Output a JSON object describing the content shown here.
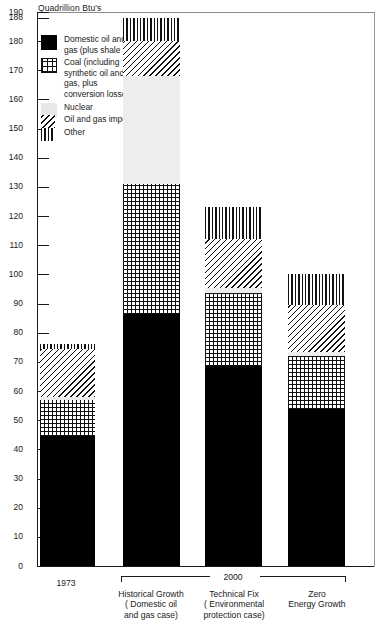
{
  "chart_data": {
    "type": "bar",
    "stacked": true,
    "title": "",
    "ylabel": "Quadrillion Btu's",
    "xlabel": "",
    "ylim": [
      0,
      190
    ],
    "yticks": [
      0,
      10,
      20,
      30,
      40,
      50,
      60,
      70,
      80,
      90,
      100,
      110,
      120,
      130,
      140,
      150,
      160,
      170,
      180,
      188,
      190
    ],
    "grid": false,
    "legend_position": "upper-left",
    "series": [
      {
        "name": "Domestic oil and gas (plus shale oil)",
        "key": "oil",
        "pattern": "solid-black",
        "values": [
          44.5,
          86.5,
          68.5,
          54.0
        ]
      },
      {
        "name": "Coal (including synthetic oil and gas, plus conversion losses)",
        "key": "coal",
        "pattern": "cross-hatch",
        "values": [
          12.5,
          44.5,
          25.0,
          18.0
        ]
      },
      {
        "name": "Nuclear",
        "key": "nuclear",
        "pattern": "light-gray",
        "values": [
          0.8,
          37.0,
          2.0,
          1.5
        ]
      },
      {
        "name": "Oil and gas imports",
        "key": "imports",
        "pattern": "diagonal-hatch",
        "values": [
          16.7,
          12.0,
          16.5,
          16.0
        ]
      },
      {
        "name": "Other",
        "key": "other",
        "pattern": "vertical-hatch",
        "values": [
          1.5,
          8.0,
          11.0,
          10.5
        ]
      }
    ],
    "categories": [
      "1973",
      "Historical Growth ( Domestic oil and gas case)",
      "Technical Fix ( Environmental protection case)",
      "Zero Energy Growth"
    ],
    "totals": [
      76,
      188,
      123,
      100
    ],
    "group_annotation": "2000"
  },
  "axis": {
    "title": "Quadrillion Btu's",
    "ticks": [
      {
        "value": 190,
        "label": "190"
      },
      {
        "value": 188,
        "label": "188"
      },
      {
        "value": 180,
        "label": "180"
      },
      {
        "value": 170,
        "label": "170"
      },
      {
        "value": 160,
        "label": "160"
      },
      {
        "value": 150,
        "label": "150"
      },
      {
        "value": 140,
        "label": "140"
      },
      {
        "value": 130,
        "label": "130"
      },
      {
        "value": 120,
        "label": "120"
      },
      {
        "value": 110,
        "label": "110"
      },
      {
        "value": 100,
        "label": "100"
      },
      {
        "value": 90,
        "label": "90"
      },
      {
        "value": 80,
        "label": "80"
      },
      {
        "value": 70,
        "label": "70"
      },
      {
        "value": 60,
        "label": "60"
      },
      {
        "value": 50,
        "label": "50"
      },
      {
        "value": 40,
        "label": "40"
      },
      {
        "value": 30,
        "label": "30"
      },
      {
        "value": 20,
        "label": "20"
      },
      {
        "value": 10,
        "label": "10"
      },
      {
        "value": 0,
        "label": "0"
      }
    ]
  },
  "legend": {
    "items": [
      {
        "swatch": "oil",
        "label": "Domestic oil\nand gas\n(plus shale oil)"
      },
      {
        "swatch": "coal",
        "label": "Coal\n(including\nsynthetic oil\nand gas, plus\nconversion\nlosses)"
      },
      {
        "swatch": "nuclear",
        "label": "Nuclear"
      },
      {
        "swatch": "imports",
        "label": "Oil and gas\nimports"
      },
      {
        "swatch": "other",
        "label": "Other"
      }
    ]
  },
  "xaxis": {
    "cat1": "1973",
    "cat2_l1": "Historical Growth",
    "cat2_l2": "( Domestic oil",
    "cat2_l3": "and gas case)",
    "cat3_l1": "Technical Fix",
    "cat3_l2": "( Environmental",
    "cat3_l3": "protection case)",
    "cat4_l1": "Zero",
    "cat4_l2": "Energy Growth",
    "group": "2000"
  },
  "colors": {
    "ink": "#1a1a1a",
    "oil": "#000000",
    "nuclear": "#ededed",
    "background": "#ffffff"
  }
}
